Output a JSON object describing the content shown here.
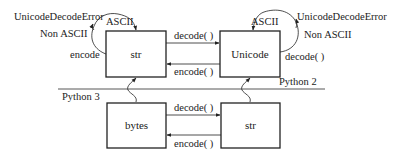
{
  "diagram": {
    "type": "string-encoding-flow",
    "python2": {
      "section_label": "Python 2",
      "left_box": "str",
      "right_box": "Unicode",
      "arrow_right_label": "decode( )",
      "arrow_left_label": "encode( )",
      "left_loop": {
        "ascii_label": "ASCII",
        "non_ascii_label": "Non ASCII",
        "error_label": "UnicodeDecodeError",
        "call_label": "encode"
      },
      "right_loop": {
        "ascii_label": "ASCII",
        "non_ascii_label": "Non ASCII",
        "error_label": "UnicodeDecodeError",
        "call_label": "decode( )"
      }
    },
    "python3": {
      "section_label": "Python 3",
      "left_box": "bytes",
      "right_box": "str",
      "arrow_right_label": "decode( )",
      "arrow_left_label": "encode( )"
    }
  }
}
